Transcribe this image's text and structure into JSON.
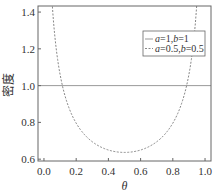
{
  "chart_data": {
    "type": "line",
    "title": "",
    "xlabel": "θ",
    "ylabel": "密度",
    "xlim": [
      -0.037,
      1.037
    ],
    "ylim": [
      0.59,
      1.433
    ],
    "xticks": [
      0.0,
      0.2,
      0.4,
      0.6,
      0.8,
      1.0
    ],
    "xtick_labels": [
      "0.0",
      "0.2",
      "0.4",
      "0.6",
      "0.8",
      "1.0"
    ],
    "yticks": [
      0.6,
      0.8,
      1.0,
      1.2,
      1.4
    ],
    "ytick_labels": [
      "0.6",
      "0.8",
      "1.0",
      "1.2",
      "1.4"
    ],
    "grid": false,
    "legend_position": "upper right",
    "series": [
      {
        "name": "a=1,b=1",
        "label_parts": [
          {
            "t": "a",
            "i": true
          },
          {
            "t": "=1,",
            "i": false
          },
          {
            "t": "b",
            "i": true
          },
          {
            "t": "=1",
            "i": false
          }
        ],
        "style": "solid",
        "color": "#999999",
        "x": [
          0.0,
          0.1,
          0.2,
          0.3,
          0.4,
          0.5,
          0.6,
          0.7,
          0.8,
          0.9,
          1.0
        ],
        "y": [
          1.0,
          1.0,
          1.0,
          1.0,
          1.0,
          1.0,
          1.0,
          1.0,
          1.0,
          1.0,
          1.0
        ]
      },
      {
        "name": "a=0.5,b=0.5",
        "label_parts": [
          {
            "t": "a",
            "i": true
          },
          {
            "t": "=0.5,",
            "i": false
          },
          {
            "t": "b",
            "i": true
          },
          {
            "t": "=0.5",
            "i": false
          }
        ],
        "style": "dashed",
        "color": "#888888",
        "x": [
          0.03,
          0.05,
          0.08,
          0.1,
          0.15,
          0.2,
          0.25,
          0.3,
          0.35,
          0.4,
          0.45,
          0.5,
          0.55,
          0.6,
          0.65,
          0.7,
          0.75,
          0.8,
          0.85,
          0.9,
          0.92,
          0.95,
          0.97
        ],
        "y": [
          1.866,
          1.46,
          1.17,
          1.061,
          0.891,
          0.796,
          0.735,
          0.695,
          0.667,
          0.65,
          0.64,
          0.637,
          0.64,
          0.65,
          0.667,
          0.695,
          0.735,
          0.796,
          0.891,
          1.061,
          1.17,
          1.46,
          1.866
        ]
      }
    ]
  }
}
